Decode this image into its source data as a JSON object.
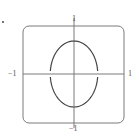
{
  "figure": {
    "panel_marker": "."
  },
  "chart_data": {
    "type": "line",
    "title": "",
    "xlabel": "",
    "ylabel": "",
    "xlim": [
      -1,
      1
    ],
    "ylim": [
      -1,
      1
    ],
    "grid": false,
    "legend": null,
    "tick_labels": {
      "x_left": "−1",
      "x_right": "1",
      "y_top": "1",
      "y_bottom": "−1"
    },
    "series": [
      {
        "name": "ellipse",
        "shape": "ellipse",
        "center": [
          0,
          0
        ],
        "semi_axis_x": 0.47,
        "semi_axis_y": 0.68,
        "gaps_at_y": [
          0
        ]
      }
    ],
    "colors": {
      "curve": "#444444",
      "axes": "#777777",
      "frame": "#777777"
    }
  }
}
